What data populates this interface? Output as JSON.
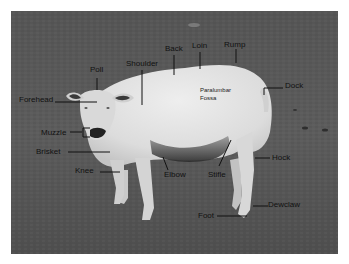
{
  "figure": {
    "colors": {
      "background": "#ffffff",
      "grass": "#595959",
      "sheep_wool": "#e2e2e2",
      "label_text": "#111111",
      "leader_line": "#111111"
    }
  },
  "labels": {
    "poll": "Poll",
    "shoulder": "Shoulder",
    "back": "Back",
    "loin": "Loin",
    "rump": "Rump",
    "dock": "Dock",
    "paralumbar_line1": "Paralumbar",
    "paralumbar_line2": "Fossa",
    "forehead": "Forehead",
    "muzzle": "Muzzle",
    "brisket": "Brisket",
    "knee": "Knee",
    "elbow": "Elbow",
    "stifle": "Stifle",
    "hock": "Hock",
    "dewclaw": "Dewclaw",
    "foot": "Foot"
  }
}
